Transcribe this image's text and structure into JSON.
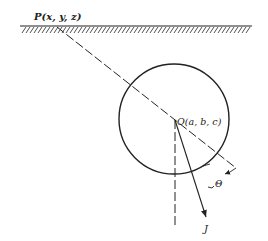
{
  "figure": {
    "point_p_label": "P(x, y, z)",
    "point_o_label": "O(a, b, c)",
    "angle_label": "Θ",
    "vector_label": "J",
    "colors": {
      "ink": "#222222",
      "background": "#ffffff"
    }
  }
}
